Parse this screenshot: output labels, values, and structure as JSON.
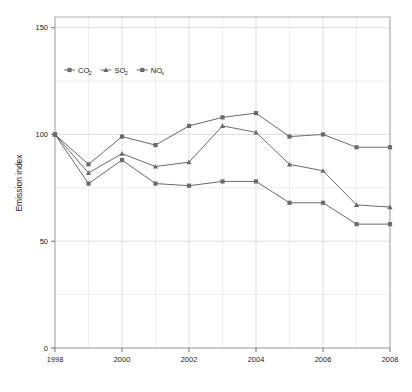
{
  "chart_data": {
    "type": "line",
    "title": "",
    "xlabel": "",
    "ylabel": "Emission index",
    "x": [
      1998,
      1999,
      2000,
      2001,
      2002,
      2003,
      2004,
      2005,
      2006,
      2007,
      2008
    ],
    "xlim": [
      1998,
      2008
    ],
    "ylim": [
      0,
      155
    ],
    "xticks": [
      1998,
      2000,
      2002,
      2004,
      2006,
      2008
    ],
    "xtick_labels": [
      "1998",
      "2000",
      "2002",
      "2004",
      "2006",
      "2008"
    ],
    "yticks": [
      0,
      50,
      100,
      150
    ],
    "ytick_labels": [
      "0",
      "50",
      "100",
      "150"
    ],
    "x_minor_gridlines": [
      1999,
      2001,
      2003,
      2005,
      2007
    ],
    "grid": true,
    "legend_position": "upper-left-inside",
    "series": [
      {
        "name": "CO2",
        "label_main": "CO",
        "label_sub": "2",
        "marker": "square",
        "color": "#6b6b6b",
        "values": [
          100,
          86,
          99,
          95,
          104,
          108,
          110,
          99,
          100,
          94,
          94
        ]
      },
      {
        "name": "SO2",
        "label_main": "SO",
        "label_sub": "2",
        "marker": "triangle",
        "color": "#6b6b6b",
        "values": [
          100,
          82,
          91,
          85,
          87,
          104,
          101,
          86,
          83,
          67,
          66
        ]
      },
      {
        "name": "NOx",
        "label_main": "NO",
        "label_sub": "x",
        "marker": "square",
        "color": "#6b6b6b",
        "values": [
          100,
          77,
          88,
          77,
          76,
          78,
          78,
          68,
          68,
          58,
          58
        ]
      }
    ]
  },
  "legend": {
    "entries": [
      {
        "main": "CO",
        "sub": "2"
      },
      {
        "main": "SO",
        "sub": "2"
      },
      {
        "main": "NO",
        "sub": "x"
      }
    ]
  },
  "axes": {
    "y_title": "Emission index"
  }
}
